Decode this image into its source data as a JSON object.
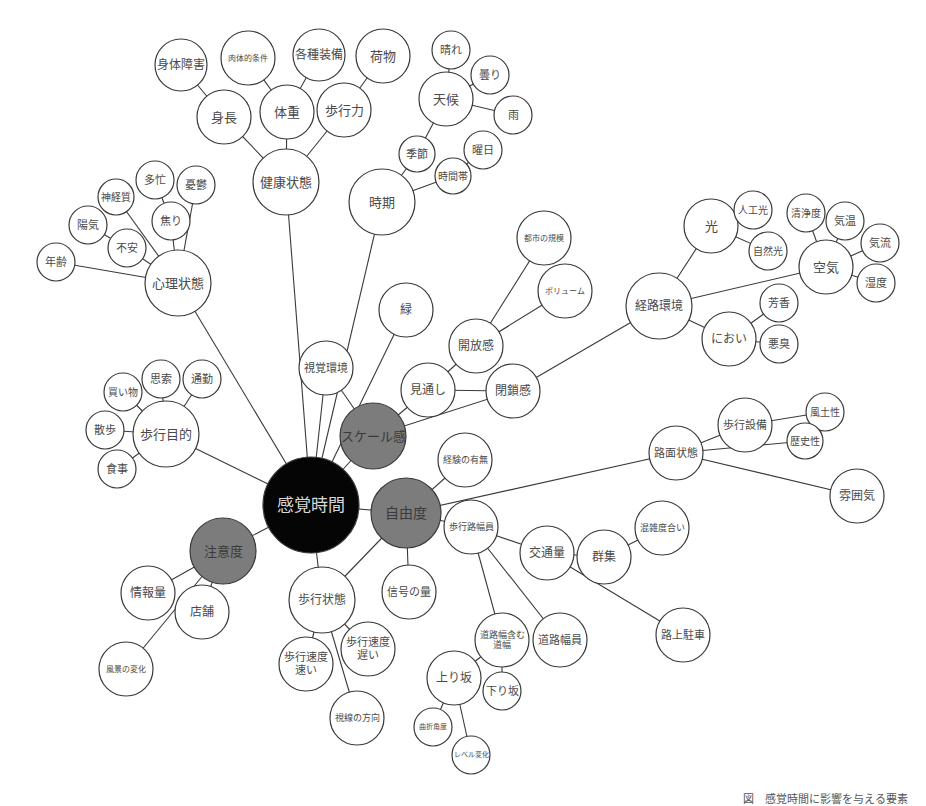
{
  "title": "感覚時間",
  "colors": {
    "root": "#050505",
    "major": "#7c7c7c",
    "leaf": "#ffffff",
    "line": "#3a3a3a"
  },
  "nodes": [
    {
      "id": "root",
      "label": "感覚時間",
      "x": 311,
      "y": 505,
      "r": 48,
      "type": "root",
      "fs": 17
    },
    {
      "id": "scale",
      "label": "スケール感",
      "x": 373,
      "y": 436,
      "r": 33,
      "type": "major",
      "fs": 13
    },
    {
      "id": "freedom",
      "label": "自由度",
      "x": 406,
      "y": 513,
      "r": 35,
      "type": "major",
      "fs": 14
    },
    {
      "id": "attention",
      "label": "注意度",
      "x": 223,
      "y": 551,
      "r": 33,
      "type": "major",
      "fs": 13
    },
    {
      "id": "health",
      "label": "健康状態",
      "x": 286,
      "y": 182,
      "r": 33,
      "type": "leaf",
      "fs": 13
    },
    {
      "id": "height",
      "label": "身長",
      "x": 224,
      "y": 117,
      "r": 27,
      "type": "leaf",
      "fs": 13
    },
    {
      "id": "disability",
      "label": "身体障害",
      "x": 181,
      "y": 65,
      "r": 26,
      "type": "leaf",
      "fs": 12
    },
    {
      "id": "physcond",
      "label": "肉体的条件",
      "x": 248,
      "y": 58,
      "r": 27,
      "type": "leaf",
      "fs": 8
    },
    {
      "id": "weight",
      "label": "体重",
      "x": 287,
      "y": 112,
      "r": 27,
      "type": "leaf",
      "fs": 13
    },
    {
      "id": "equip",
      "label": "各種装備",
      "x": 319,
      "y": 55,
      "r": 26,
      "type": "leaf",
      "fs": 12
    },
    {
      "id": "walkpower",
      "label": "歩行力",
      "x": 344,
      "y": 110,
      "r": 27,
      "type": "leaf",
      "fs": 13
    },
    {
      "id": "cargo",
      "label": "荷物",
      "x": 383,
      "y": 56,
      "r": 27,
      "type": "leaf",
      "fs": 13
    },
    {
      "id": "period",
      "label": "時期",
      "x": 382,
      "y": 202,
      "r": 33,
      "type": "leaf",
      "fs": 13
    },
    {
      "id": "season",
      "label": "季節",
      "x": 417,
      "y": 154,
      "r": 18,
      "type": "leaf",
      "fs": 11
    },
    {
      "id": "weather",
      "label": "天候",
      "x": 446,
      "y": 99,
      "r": 27,
      "type": "leaf",
      "fs": 13
    },
    {
      "id": "sunny",
      "label": "晴れ",
      "x": 451,
      "y": 50,
      "r": 19,
      "type": "leaf",
      "fs": 11
    },
    {
      "id": "cloudy",
      "label": "曇り",
      "x": 490,
      "y": 75,
      "r": 19,
      "type": "leaf",
      "fs": 11
    },
    {
      "id": "rain",
      "label": "雨",
      "x": 513,
      "y": 115,
      "r": 19,
      "type": "leaf",
      "fs": 11
    },
    {
      "id": "dayofweek",
      "label": "曜日",
      "x": 483,
      "y": 150,
      "r": 19,
      "type": "leaf",
      "fs": 11
    },
    {
      "id": "timeofday",
      "label": "時間帯",
      "x": 453,
      "y": 176,
      "r": 18,
      "type": "leaf",
      "fs": 10
    },
    {
      "id": "psych",
      "label": "心理状態",
      "x": 178,
      "y": 283,
      "r": 33,
      "type": "leaf",
      "fs": 13
    },
    {
      "id": "age",
      "label": "年齢",
      "x": 56,
      "y": 262,
      "r": 19,
      "type": "leaf",
      "fs": 11
    },
    {
      "id": "cheerful",
      "label": "陽気",
      "x": 88,
      "y": 225,
      "r": 19,
      "type": "leaf",
      "fs": 11
    },
    {
      "id": "anxiety",
      "label": "不安",
      "x": 127,
      "y": 248,
      "r": 19,
      "type": "leaf",
      "fs": 11
    },
    {
      "id": "nervous",
      "label": "神経質",
      "x": 116,
      "y": 197,
      "r": 18,
      "type": "leaf",
      "fs": 10
    },
    {
      "id": "busy",
      "label": "多忙",
      "x": 155,
      "y": 180,
      "r": 19,
      "type": "leaf",
      "fs": 11
    },
    {
      "id": "impatience",
      "label": "焦り",
      "x": 171,
      "y": 221,
      "r": 19,
      "type": "leaf",
      "fs": 11
    },
    {
      "id": "melancholy",
      "label": "憂鬱",
      "x": 196,
      "y": 185,
      "r": 19,
      "type": "leaf",
      "fs": 11
    },
    {
      "id": "visual",
      "label": "視覚環境",
      "x": 326,
      "y": 368,
      "r": 27,
      "type": "leaf",
      "fs": 11
    },
    {
      "id": "green",
      "label": "緑",
      "x": 406,
      "y": 310,
      "r": 27,
      "type": "leaf",
      "fs": 12
    },
    {
      "id": "openness",
      "label": "開放感",
      "x": 476,
      "y": 346,
      "r": 27,
      "type": "leaf",
      "fs": 12
    },
    {
      "id": "citysize",
      "label": "都市の規模",
      "x": 544,
      "y": 238,
      "r": 27,
      "type": "leaf",
      "fs": 8
    },
    {
      "id": "volume",
      "label": "ボリューム",
      "x": 565,
      "y": 291,
      "r": 27,
      "type": "leaf",
      "fs": 8
    },
    {
      "id": "prospect",
      "label": "見通し",
      "x": 428,
      "y": 390,
      "r": 27,
      "type": "leaf",
      "fs": 12
    },
    {
      "id": "closure",
      "label": "閉鎖感",
      "x": 513,
      "y": 391,
      "r": 27,
      "type": "leaf",
      "fs": 12
    },
    {
      "id": "route",
      "label": "経路環境",
      "x": 659,
      "y": 306,
      "r": 33,
      "type": "leaf",
      "fs": 12
    },
    {
      "id": "light",
      "label": "光",
      "x": 711,
      "y": 226,
      "r": 27,
      "type": "leaf",
      "fs": 13
    },
    {
      "id": "artlight",
      "label": "人工光",
      "x": 753,
      "y": 210,
      "r": 19,
      "type": "leaf",
      "fs": 10
    },
    {
      "id": "natlight",
      "label": "自然光",
      "x": 768,
      "y": 251,
      "r": 19,
      "type": "leaf",
      "fs": 10
    },
    {
      "id": "air",
      "label": "空気",
      "x": 826,
      "y": 267,
      "r": 27,
      "type": "leaf",
      "fs": 13
    },
    {
      "id": "clean",
      "label": "清浄度",
      "x": 806,
      "y": 213,
      "r": 19,
      "type": "leaf",
      "fs": 10
    },
    {
      "id": "temp",
      "label": "気温",
      "x": 845,
      "y": 221,
      "r": 19,
      "type": "leaf",
      "fs": 11
    },
    {
      "id": "airflow",
      "label": "気流",
      "x": 880,
      "y": 243,
      "r": 19,
      "type": "leaf",
      "fs": 11
    },
    {
      "id": "humidity",
      "label": "湿度",
      "x": 876,
      "y": 283,
      "r": 19,
      "type": "leaf",
      "fs": 11
    },
    {
      "id": "smell",
      "label": "におい",
      "x": 729,
      "y": 339,
      "r": 27,
      "type": "leaf",
      "fs": 12
    },
    {
      "id": "aroma",
      "label": "芳香",
      "x": 779,
      "y": 303,
      "r": 19,
      "type": "leaf",
      "fs": 11
    },
    {
      "id": "odor",
      "label": "悪臭",
      "x": 779,
      "y": 344,
      "r": 19,
      "type": "leaf",
      "fs": 11
    },
    {
      "id": "purpose",
      "label": "歩行目的",
      "x": 166,
      "y": 434,
      "r": 33,
      "type": "leaf",
      "fs": 13
    },
    {
      "id": "shopping",
      "label": "買い物",
      "x": 123,
      "y": 392,
      "r": 19,
      "type": "leaf",
      "fs": 10
    },
    {
      "id": "thinking",
      "label": "思索",
      "x": 161,
      "y": 379,
      "r": 19,
      "type": "leaf",
      "fs": 11
    },
    {
      "id": "commute",
      "label": "通勤",
      "x": 202,
      "y": 379,
      "r": 19,
      "type": "leaf",
      "fs": 11
    },
    {
      "id": "stroll",
      "label": "散歩",
      "x": 105,
      "y": 430,
      "r": 19,
      "type": "leaf",
      "fs": 11
    },
    {
      "id": "meal",
      "label": "食事",
      "x": 117,
      "y": 469,
      "r": 19,
      "type": "leaf",
      "fs": 11
    },
    {
      "id": "experience",
      "label": "経験の有無",
      "x": 465,
      "y": 460,
      "r": 27,
      "type": "leaf",
      "fs": 9
    },
    {
      "id": "surface",
      "label": "路面状態",
      "x": 676,
      "y": 453,
      "r": 27,
      "type": "leaf",
      "fs": 11
    },
    {
      "id": "walkfac",
      "label": "歩行設備",
      "x": 745,
      "y": 425,
      "r": 27,
      "type": "leaf",
      "fs": 11
    },
    {
      "id": "climate",
      "label": "風土性",
      "x": 825,
      "y": 412,
      "r": 19,
      "type": "leaf",
      "fs": 10
    },
    {
      "id": "history",
      "label": "歴史性",
      "x": 805,
      "y": 441,
      "r": 18,
      "type": "leaf",
      "fs": 10
    },
    {
      "id": "atmosphere",
      "label": "雰囲気",
      "x": 857,
      "y": 496,
      "r": 27,
      "type": "leaf",
      "fs": 12
    },
    {
      "id": "sidewalk",
      "label": "歩行路幅員",
      "x": 471,
      "y": 527,
      "r": 27,
      "type": "leaf",
      "fs": 9
    },
    {
      "id": "traffic",
      "label": "交通量",
      "x": 547,
      "y": 553,
      "r": 27,
      "type": "leaf",
      "fs": 12
    },
    {
      "id": "crowd",
      "label": "群集",
      "x": 604,
      "y": 557,
      "r": 27,
      "type": "leaf",
      "fs": 12
    },
    {
      "id": "congestion",
      "label": "混雑度合い",
      "x": 662,
      "y": 528,
      "r": 27,
      "type": "leaf",
      "fs": 9
    },
    {
      "id": "parking",
      "label": "路上駐車",
      "x": 683,
      "y": 635,
      "r": 27,
      "type": "leaf",
      "fs": 11
    },
    {
      "id": "signals",
      "label": "信号の量",
      "x": 409,
      "y": 592,
      "r": 27,
      "type": "leaf",
      "fs": 11
    },
    {
      "id": "roadincl",
      "label": "道路幅含む\n道幅",
      "x": 502,
      "y": 640,
      "r": 27,
      "type": "leaf",
      "fs": 9
    },
    {
      "id": "roadwidth",
      "label": "道路幅員",
      "x": 560,
      "y": 640,
      "r": 27,
      "type": "leaf",
      "fs": 11
    },
    {
      "id": "uphill",
      "label": "上り坂",
      "x": 454,
      "y": 678,
      "r": 27,
      "type": "leaf",
      "fs": 12
    },
    {
      "id": "downhill",
      "label": "下り坂",
      "x": 502,
      "y": 691,
      "r": 19,
      "type": "leaf",
      "fs": 11
    },
    {
      "id": "bend",
      "label": "曲折角度",
      "x": 433,
      "y": 727,
      "r": 19,
      "type": "leaf",
      "fs": 7
    },
    {
      "id": "level",
      "label": "レベル変化",
      "x": 471,
      "y": 755,
      "r": 19,
      "type": "leaf",
      "fs": 7
    },
    {
      "id": "walkstate",
      "label": "歩行状態",
      "x": 322,
      "y": 600,
      "r": 33,
      "type": "leaf",
      "fs": 12
    },
    {
      "id": "speedfast",
      "label": "歩行速度\n速い",
      "x": 306,
      "y": 664,
      "r": 27,
      "type": "leaf",
      "fs": 11
    },
    {
      "id": "speedslow",
      "label": "歩行速度\n遅い",
      "x": 368,
      "y": 649,
      "r": 27,
      "type": "leaf",
      "fs": 11
    },
    {
      "id": "gaze",
      "label": "視線の方向",
      "x": 357,
      "y": 718,
      "r": 27,
      "type": "leaf",
      "fs": 9
    },
    {
      "id": "info",
      "label": "情報量",
      "x": 148,
      "y": 593,
      "r": 27,
      "type": "leaf",
      "fs": 12
    },
    {
      "id": "shop",
      "label": "店舗",
      "x": 202,
      "y": 612,
      "r": 27,
      "type": "leaf",
      "fs": 12
    },
    {
      "id": "scenery",
      "label": "風景の変化",
      "x": 126,
      "y": 669,
      "r": 27,
      "type": "leaf",
      "fs": 8
    }
  ],
  "edges": [
    [
      "root",
      "health"
    ],
    [
      "root",
      "period"
    ],
    [
      "root",
      "psych"
    ],
    [
      "root",
      "purpose"
    ],
    [
      "root",
      "attention"
    ],
    [
      "root",
      "visual"
    ],
    [
      "root",
      "scale"
    ],
    [
      "root",
      "freedom"
    ],
    [
      "root",
      "walkstate"
    ],
    [
      "root",
      "green"
    ],
    [
      "health",
      "height"
    ],
    [
      "health",
      "weight"
    ],
    [
      "health",
      "walkpower"
    ],
    [
      "height",
      "disability"
    ],
    [
      "weight",
      "physcond"
    ],
    [
      "weight",
      "equip"
    ],
    [
      "walkpower",
      "cargo"
    ],
    [
      "period",
      "season"
    ],
    [
      "period",
      "timeofday"
    ],
    [
      "season",
      "weather"
    ],
    [
      "weather",
      "sunny"
    ],
    [
      "weather",
      "cloudy"
    ],
    [
      "weather",
      "rain"
    ],
    [
      "timeofday",
      "dayofweek"
    ],
    [
      "psych",
      "age"
    ],
    [
      "psych",
      "anxiety"
    ],
    [
      "psych",
      "nervous"
    ],
    [
      "psych",
      "impatience"
    ],
    [
      "psych",
      "melancholy"
    ],
    [
      "anxiety",
      "cheerful"
    ],
    [
      "impatience",
      "busy"
    ],
    [
      "visual",
      "scale"
    ],
    [
      "scale",
      "prospect"
    ],
    [
      "scale",
      "closure"
    ],
    [
      "prospect",
      "openness"
    ],
    [
      "prospect",
      "closure"
    ],
    [
      "openness",
      "citysize"
    ],
    [
      "openness",
      "volume"
    ],
    [
      "closure",
      "route"
    ],
    [
      "route",
      "light"
    ],
    [
      "route",
      "air"
    ],
    [
      "route",
      "smell"
    ],
    [
      "light",
      "artlight"
    ],
    [
      "light",
      "natlight"
    ],
    [
      "air",
      "clean"
    ],
    [
      "air",
      "temp"
    ],
    [
      "air",
      "airflow"
    ],
    [
      "air",
      "humidity"
    ],
    [
      "smell",
      "aroma"
    ],
    [
      "smell",
      "odor"
    ],
    [
      "purpose",
      "shopping"
    ],
    [
      "purpose",
      "thinking"
    ],
    [
      "purpose",
      "commute"
    ],
    [
      "purpose",
      "stroll"
    ],
    [
      "purpose",
      "meal"
    ],
    [
      "freedom",
      "experience"
    ],
    [
      "freedom",
      "surface"
    ],
    [
      "freedom",
      "sidewalk"
    ],
    [
      "freedom",
      "signals"
    ],
    [
      "freedom",
      "walkstate"
    ],
    [
      "surface",
      "walkfac"
    ],
    [
      "surface",
      "history"
    ],
    [
      "surface",
      "atmosphere"
    ],
    [
      "walkfac",
      "climate"
    ],
    [
      "sidewalk",
      "traffic"
    ],
    [
      "sidewalk",
      "roadincl"
    ],
    [
      "sidewalk",
      "roadwidth"
    ],
    [
      "traffic",
      "crowd"
    ],
    [
      "traffic",
      "parking"
    ],
    [
      "crowd",
      "congestion"
    ],
    [
      "roadincl",
      "uphill"
    ],
    [
      "roadincl",
      "downhill"
    ],
    [
      "uphill",
      "bend"
    ],
    [
      "uphill",
      "level"
    ],
    [
      "walkstate",
      "speedfast"
    ],
    [
      "walkstate",
      "speedslow"
    ],
    [
      "walkstate",
      "gaze"
    ],
    [
      "attention",
      "info"
    ],
    [
      "attention",
      "shop"
    ],
    [
      "attention",
      "scenery"
    ]
  ],
  "footer_caption": "図　感覚時間に影響を与える要素"
}
